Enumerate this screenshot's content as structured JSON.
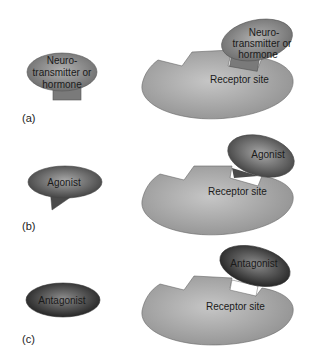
{
  "figure": {
    "panels": [
      {
        "label": "(a)",
        "ligand": {
          "name": "Neurotransmitter or hormone",
          "lines": [
            "Neuro-",
            "transmitter or",
            "hormone"
          ]
        },
        "bound_ligand": {
          "lines": [
            "Neuro-",
            "transmitter or",
            "hormone"
          ]
        },
        "receptor": {
          "label": "Receptor site"
        }
      },
      {
        "label": "(b)",
        "ligand": {
          "name": "Agonist",
          "lines": [
            "Agonist"
          ]
        },
        "bound_ligand": {
          "lines": [
            "Agonist"
          ]
        },
        "receptor": {
          "label": "Receptor site"
        }
      },
      {
        "label": "(c)",
        "ligand": {
          "name": "Antagonist",
          "lines": [
            "Antagonist"
          ]
        },
        "bound_ligand": {
          "lines": [
            "Antagonist"
          ]
        },
        "receptor": {
          "label": "Receptor site"
        }
      }
    ],
    "colors": {
      "receptor_fill": "#a8a8a8",
      "neurotransmitter_fill": "#8a8a8a",
      "agonist_fill": "#6e6e6e",
      "antagonist_fill": "#3a3a3a",
      "outline": "#555555"
    }
  }
}
